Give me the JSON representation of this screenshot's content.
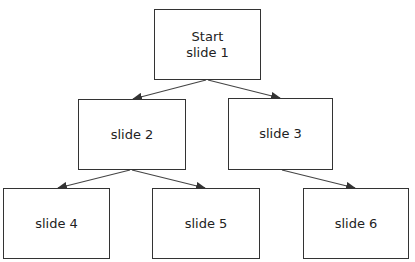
{
  "diagram": {
    "type": "tree",
    "nodes": [
      {
        "id": "n1",
        "label": "Start\nslide 1"
      },
      {
        "id": "n2",
        "label": "slide 2"
      },
      {
        "id": "n3",
        "label": "slide 3"
      },
      {
        "id": "n4",
        "label": "slide 4"
      },
      {
        "id": "n5",
        "label": "slide 5"
      },
      {
        "id": "n6",
        "label": "slide 6"
      }
    ],
    "edges": [
      {
        "from": "n1",
        "to": "n2"
      },
      {
        "from": "n1",
        "to": "n3"
      },
      {
        "from": "n2",
        "to": "n4"
      },
      {
        "from": "n2",
        "to": "n5"
      },
      {
        "from": "n3",
        "to": "n6"
      }
    ]
  }
}
